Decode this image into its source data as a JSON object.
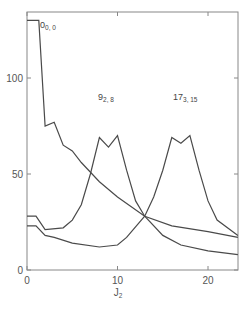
{
  "chart_data": {
    "type": "line",
    "title": "",
    "xlabel": "J2",
    "ylabel": "",
    "xlim": [
      0,
      23.3
    ],
    "ylim": [
      0,
      135
    ],
    "grid": false,
    "legend": "none (curves labeled inline)",
    "x_ticks": [
      0,
      10,
      20
    ],
    "y_ticks": [
      0,
      50,
      100
    ],
    "series": [
      {
        "name": "0_{0,0}",
        "label_main": "0",
        "label_sub": "0, 0",
        "x": [
          0,
          1.3,
          2,
          3,
          4,
          5,
          6,
          8,
          10,
          13,
          16,
          20,
          23.3
        ],
        "y": [
          130,
          130,
          75,
          77,
          65,
          62,
          56,
          46,
          38,
          28,
          23,
          20,
          17
        ]
      },
      {
        "name": "9_{2,8}",
        "label_main": "9",
        "label_sub": "2, 8",
        "x": [
          0,
          1,
          2,
          4,
          5,
          6,
          7,
          8,
          9,
          10,
          11,
          12,
          13,
          15,
          17,
          20,
          23.3
        ],
        "y": [
          28,
          28,
          21,
          22,
          26,
          34,
          50,
          69,
          64,
          70,
          52,
          36,
          28,
          18,
          13,
          10,
          8
        ]
      },
      {
        "name": "17_{3,15}",
        "label_main": "17",
        "label_sub": "3, 15",
        "x": [
          0,
          1,
          2,
          3,
          5,
          8,
          10,
          11,
          13,
          14,
          15,
          16,
          17,
          18,
          19,
          20,
          21,
          23.3
        ],
        "y": [
          23,
          23,
          18,
          17,
          14,
          12,
          13,
          17,
          28,
          38,
          52,
          69,
          66,
          70,
          52,
          36,
          26,
          18
        ]
      }
    ]
  },
  "axis": {
    "x_tick_labels": [
      "0",
      "10",
      "20"
    ],
    "y_tick_labels": [
      "0",
      "50",
      "100"
    ],
    "xlabel_main": "J",
    "xlabel_sub": "2"
  }
}
